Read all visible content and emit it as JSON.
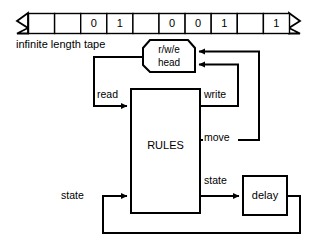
{
  "diagram": {
    "colors": {
      "stroke": "#000000",
      "background": "#ffffff",
      "fill": "#ffffff"
    },
    "tape": {
      "caption": "infinite length tape",
      "cells": [
        "",
        "",
        "0",
        "1",
        "",
        "0",
        "0",
        "1",
        "",
        "1"
      ]
    },
    "blocks": {
      "head": {
        "line1": "r/w/e",
        "line2": "head"
      },
      "rules": {
        "label": "RULES"
      },
      "delay": {
        "label": "delay"
      }
    },
    "signals": {
      "read": "read",
      "write": "write",
      "move": "move",
      "state_in": "state",
      "state_out": "state"
    }
  }
}
